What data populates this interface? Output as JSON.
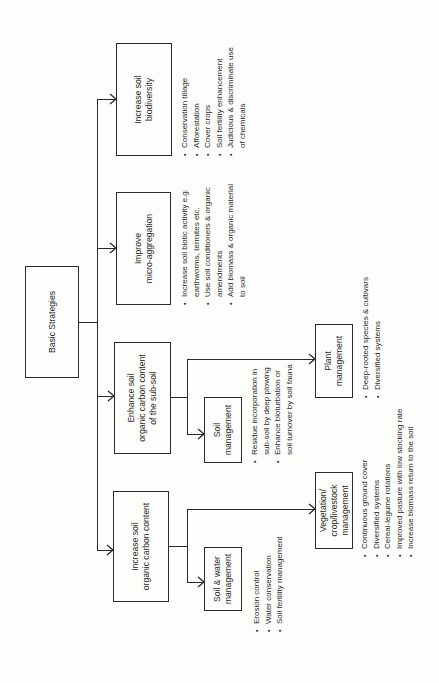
{
  "root": {
    "label": "Basic Strategies"
  },
  "strategies": [
    {
      "label": "Increase soil\nbiodiversity",
      "bullets": [
        "Conservation tillage",
        "Afforestation",
        "Cover crops",
        "Soil fertility enhancement",
        "Judicious & discriminate use\nof chemicals"
      ]
    },
    {
      "label": "Improve\nmicro-aggregation",
      "bullets": [
        "Increase soil biotic activity e.g.\nearthworms, termites etc.",
        "Use soil conditioners & organic\namendments",
        "Add biomass & organic material\nto soil"
      ]
    },
    {
      "label": "Enhance soil\norganic carbon content\nof the sub-soil",
      "children": [
        {
          "label": "Soil\nmanagement",
          "bullets": [
            "Residue incorporation in\nsub-soil by deep plowing",
            "Enhance bioturbation or\nsoil turnover by soil fauna"
          ]
        },
        {
          "label": "Plant\nmanagement",
          "bullets": [
            "Deep-rooted species & cultivars",
            "Diversified systems"
          ]
        }
      ]
    },
    {
      "label": "Increase soil\norganic carbon content",
      "children": [
        {
          "label": "Soil & water\nmanagement",
          "bullets": [
            "Erosion control",
            "Water conservation",
            "Soil fertility management"
          ]
        },
        {
          "label": "Vegetation/\ncrop/livestock\nmanagement",
          "bullets": [
            "Continuous ground cover",
            "Diversified systems",
            "Cereal-legume rotations",
            "Improved pasture with low stocking rate",
            "Increase biomass return to the soil"
          ]
        }
      ]
    }
  ],
  "colors": {
    "line": "#2a2a2a",
    "background": "#fdfdfb"
  }
}
